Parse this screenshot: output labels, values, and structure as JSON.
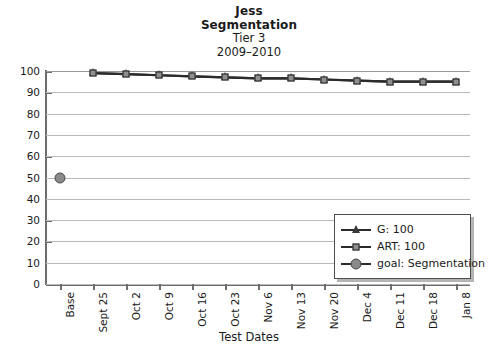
{
  "chart_data": {
    "type": "line",
    "title": "Jess",
    "title_line2": "Segmentation",
    "subtitle": "Tier 3",
    "subtitle2": "2009–2010",
    "xlabel": "Test Dates",
    "ylabel": "",
    "ylim": [
      0,
      100
    ],
    "ytick_step": 10,
    "grid": true,
    "legend_position": "bottom-right",
    "categories": [
      "Base",
      "Sept 25",
      "Oct 2",
      "Oct 9",
      "Oct 16",
      "Oct 23",
      "Nov 6",
      "Nov 13",
      "Nov 20",
      "Dec 4",
      "Dec 11",
      "Dec 18",
      "Jan 8"
    ],
    "yticks": [
      "0",
      "10",
      "20",
      "30",
      "40",
      "50",
      "60",
      "70",
      "80",
      "90",
      "100"
    ],
    "series": [
      {
        "name": "G: 100",
        "marker": "triangle",
        "values": [
          null,
          99,
          98.5,
          98,
          97.5,
          97,
          96.5,
          96.5,
          96,
          95.5,
          95,
          95,
          95
        ]
      },
      {
        "name": "ART: 100",
        "marker": "square",
        "values": [
          null,
          99,
          98.5,
          98,
          97.5,
          97,
          96.5,
          96.5,
          96,
          95.5,
          95,
          95,
          95
        ]
      },
      {
        "name": "goal: Segmentation",
        "marker": "circle",
        "values": [
          50,
          null,
          null,
          null,
          null,
          null,
          null,
          null,
          null,
          null,
          null,
          null,
          null
        ]
      }
    ]
  },
  "legend": {
    "items": [
      {
        "label": "G: 100",
        "marker": "triangle"
      },
      {
        "label": "ART: 100",
        "marker": "square"
      },
      {
        "label": "goal: Segmentation",
        "marker": "circle"
      }
    ]
  },
  "colors": {
    "line": "#2b2b2b",
    "marker_fill": "#8f8f8f",
    "marker_edge": "#1f1f1f",
    "grid": "#b9b9b9",
    "axis": "#6d6d6d",
    "background": "#ffffff"
  }
}
